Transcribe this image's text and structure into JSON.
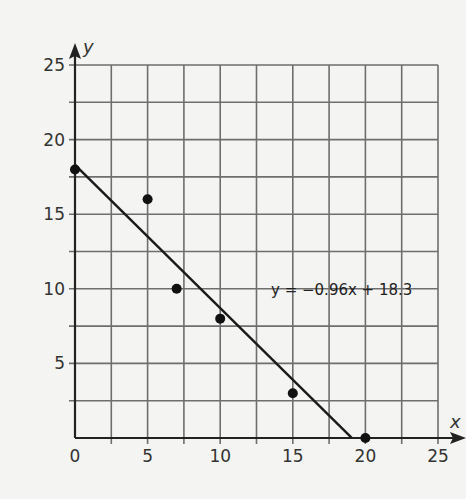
{
  "chart_data": {
    "type": "scatter",
    "title": "",
    "xlabel": "x",
    "ylabel": "y",
    "xlim": [
      0,
      25
    ],
    "ylim": [
      0,
      25
    ],
    "x_ticks": [
      0,
      5,
      10,
      15,
      20,
      25
    ],
    "y_ticks": [
      5,
      10,
      15,
      20,
      25
    ],
    "grid_step": 2.5,
    "grid": true,
    "points": [
      {
        "x": 0,
        "y": 18
      },
      {
        "x": 5,
        "y": 16
      },
      {
        "x": 7,
        "y": 10
      },
      {
        "x": 10,
        "y": 8
      },
      {
        "x": 15,
        "y": 3
      },
      {
        "x": 20,
        "y": 0
      }
    ],
    "trendline": {
      "slope": -0.96,
      "intercept": 18.3,
      "label": "y = −0.96x + 18.3",
      "x_range": [
        0,
        19.06
      ]
    },
    "colors": {
      "background": "#f4f4f2",
      "grid": "#6e6e6e",
      "axis": "#222222",
      "points": "#111111",
      "line": "#1a1a1a"
    }
  }
}
